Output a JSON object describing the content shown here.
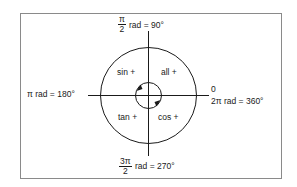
{
  "diagram": {
    "axes": {
      "top": {
        "fraction_numerator": "π",
        "fraction_denominator": "2",
        "text": "rad  =  90°"
      },
      "left": {
        "text": "π rad  =  180°"
      },
      "right_upper": {
        "text": "0"
      },
      "right_lower": {
        "text": "2π rad  =  360°"
      },
      "bottom": {
        "fraction_numerator": "3π",
        "fraction_denominator": "2",
        "text": "rad  =  270°"
      }
    },
    "quadrants": [
      {
        "position": "top-left",
        "label": "sin +"
      },
      {
        "position": "top-right",
        "label": "all +"
      },
      {
        "position": "bottom-left",
        "label": "tan +"
      },
      {
        "position": "bottom-right",
        "label": "cos +"
      }
    ],
    "rotation_direction": "counter-clockwise",
    "colors": {
      "line": "#1a1a1a",
      "frame": "#8a8a8a",
      "background": "#ffffff"
    }
  }
}
